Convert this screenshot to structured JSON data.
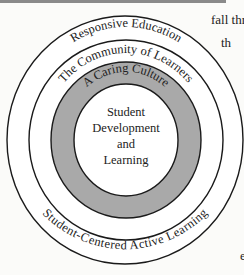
{
  "diagram": {
    "rings": [
      {
        "label": "Responsive Education",
        "fill": "#ffffff"
      },
      {
        "label": "The Community of Learners",
        "fill": "#ffffff"
      },
      {
        "label": "A Caring Culture",
        "fill": "#a9a9a9"
      }
    ],
    "bottom_label": "Student-Centered Active Learning",
    "center": {
      "lines": [
        "Student",
        "Development",
        "and",
        "Learning"
      ]
    }
  },
  "side_text": {
    "line1": "fall thr",
    "line2": "th",
    "line3": "e"
  },
  "colors": {
    "gray_ring": "#a9a9a9",
    "stroke": "#1a1a1a",
    "background": "#fbfbf9"
  }
}
